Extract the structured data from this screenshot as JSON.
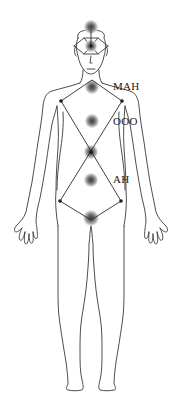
{
  "diagram": {
    "title": "",
    "colors": {
      "outline": "#3a3a3a",
      "glow_center": "#4a4a4a",
      "glow_edge": "#ffffff",
      "node": "#1a1a1a",
      "label": "#222222",
      "background": "#ffffff"
    },
    "labels": [
      {
        "text": "MAH",
        "x": 113,
        "y": 81
      },
      {
        "text": "OOO",
        "x": 113,
        "y": 116
      },
      {
        "text": "AH",
        "x": 113,
        "y": 174
      }
    ],
    "centers": [
      {
        "name": "crown",
        "x": 91,
        "y": 27
      },
      {
        "name": "brow",
        "x": 91,
        "y": 46
      },
      {
        "name": "throat",
        "x": 92,
        "y": 87
      },
      {
        "name": "heart",
        "x": 92,
        "y": 121
      },
      {
        "name": "solar",
        "x": 91,
        "y": 152
      },
      {
        "name": "navel",
        "x": 91,
        "y": 180
      },
      {
        "name": "root",
        "x": 91,
        "y": 218
      }
    ],
    "nodes": [
      {
        "name": "left-shoulder",
        "x": 61,
        "y": 101
      },
      {
        "name": "right-shoulder",
        "x": 122,
        "y": 101
      },
      {
        "name": "left-hip",
        "x": 60,
        "y": 201
      },
      {
        "name": "right-hip",
        "x": 121,
        "y": 201
      }
    ]
  }
}
